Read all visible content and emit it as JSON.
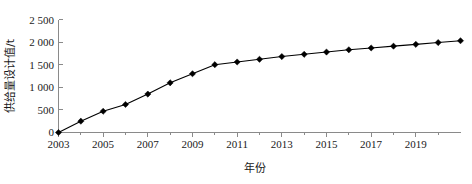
{
  "chart_data": {
    "type": "line",
    "title": "",
    "xlabel": "年份",
    "ylabel": "供给量设计值/t",
    "x": [
      2003,
      2004,
      2005,
      2006,
      2007,
      2008,
      2009,
      2010,
      2011,
      2012,
      2013,
      2014,
      2015,
      2016,
      2017,
      2018,
      2019,
      2020,
      2021
    ],
    "values": [
      0,
      250,
      470,
      620,
      850,
      1100,
      1300,
      1500,
      1560,
      1620,
      1680,
      1730,
      1780,
      1830,
      1870,
      1910,
      1950,
      1990,
      2030
    ],
    "series": [
      {
        "name": "供给量设计值",
        "marker": "diamond",
        "color": "#000000",
        "values": [
          0,
          250,
          470,
          620,
          850,
          1100,
          1300,
          1500,
          1560,
          1620,
          1680,
          1730,
          1780,
          1830,
          1870,
          1910,
          1950,
          1990,
          2030
        ]
      }
    ],
    "xlim": [
      2003,
      2021
    ],
    "ylim": [
      0,
      2500
    ],
    "ytick_labels": [
      "0",
      "500",
      "1 000",
      "1 500",
      "2 000",
      "2 500"
    ],
    "ytick_values": [
      0,
      500,
      1000,
      1500,
      2000,
      2500
    ],
    "xtick_labels": [
      "2003",
      "2005",
      "2007",
      "2009",
      "2011",
      "2013",
      "2015",
      "2017",
      "2019"
    ],
    "xtick_values": [
      2003,
      2005,
      2007,
      2009,
      2011,
      2013,
      2015,
      2017,
      2019
    ],
    "xminor_values": [
      2004,
      2006,
      2008,
      2010,
      2012,
      2014,
      2016,
      2018,
      2020
    ],
    "grid": false,
    "legend": null,
    "legend_position": "none",
    "annotations": []
  },
  "colors": {
    "background": "#ffffff",
    "axis": "#8a8a8a",
    "series": "#000000",
    "text": "#1a1a1a"
  }
}
